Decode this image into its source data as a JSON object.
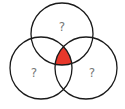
{
  "diagram": {
    "type": "venn",
    "sets": [
      {
        "id": "top",
        "label": "?"
      },
      {
        "id": "bottom-left",
        "label": "?"
      },
      {
        "id": "bottom-right",
        "label": "?"
      }
    ],
    "highlighted_region": "intersection of all three sets",
    "highlight_color": "#e8382b",
    "stroke_color": "#1a1a1a",
    "label_color": "#777777"
  }
}
